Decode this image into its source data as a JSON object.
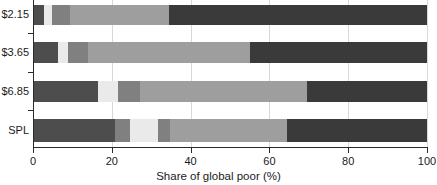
{
  "chart_data": {
    "type": "bar",
    "orientation": "horizontal",
    "stacked": true,
    "title": "",
    "xlabel": "Share of global poor (%)",
    "ylabel": "",
    "xlim": [
      0,
      100
    ],
    "xticks": [
      0,
      20,
      40,
      60,
      80,
      100
    ],
    "xtick_labels": [
      "0",
      "20",
      "40",
      "60",
      "80",
      "100"
    ],
    "categories": [
      "$2.15",
      "$3.65",
      "$6.85",
      "SPL"
    ],
    "grid": true,
    "grid_axis": "x",
    "legend": "none",
    "colors": {
      "dark": "#4d4d4d",
      "light": "#eaeaea",
      "medium_dark": "#808080",
      "light_gray": "#9e9e9e",
      "darkest": "#3a3a3a",
      "axis": "#2b2b2b",
      "gridline": "#d8d8d8",
      "background": "#ffffff"
    },
    "rows": [
      {
        "category": "$2.15",
        "segments": [
          {
            "color": "#4d4d4d",
            "value": 2.8
          },
          {
            "color": "#eaeaea",
            "value": 2.0
          },
          {
            "color": "#808080",
            "value": 4.6
          },
          {
            "color": "#9e9e9e",
            "value": 25.1
          },
          {
            "color": "#3a3a3a",
            "value": 65.5
          }
        ]
      },
      {
        "category": "$3.65",
        "segments": [
          {
            "color": "#4d4d4d",
            "value": 6.3
          },
          {
            "color": "#eaeaea",
            "value": 2.5
          },
          {
            "color": "#808080",
            "value": 5.1
          },
          {
            "color": "#9e9e9e",
            "value": 41.1
          },
          {
            "color": "#3a3a3a",
            "value": 45.0
          }
        ]
      },
      {
        "category": "$6.85",
        "segments": [
          {
            "color": "#4d4d4d",
            "value": 16.5
          },
          {
            "color": "#eaeaea",
            "value": 5.1
          },
          {
            "color": "#808080",
            "value": 5.6
          },
          {
            "color": "#9e9e9e",
            "value": 42.4
          },
          {
            "color": "#3a3a3a",
            "value": 30.4
          }
        ]
      },
      {
        "category": "SPL",
        "segments": [
          {
            "color": "#4d4d4d",
            "value": 20.8
          },
          {
            "color": "#808080",
            "value": 3.8
          },
          {
            "color": "#eaeaea",
            "value": 7.1
          },
          {
            "color": "#808080",
            "value": 3.0
          },
          {
            "color": "#9e9e9e",
            "value": 29.7
          },
          {
            "color": "#3a3a3a",
            "value": 35.6
          }
        ]
      }
    ]
  }
}
